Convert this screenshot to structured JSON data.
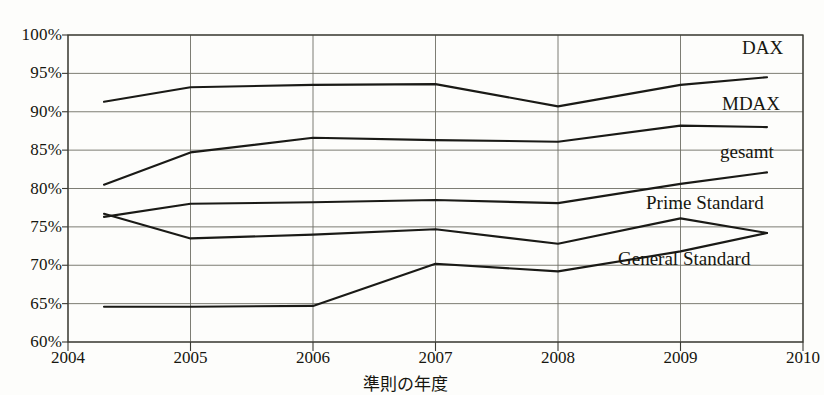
{
  "chart_data": {
    "type": "line",
    "title": "",
    "xlabel": "準則の年度",
    "ylabel": "",
    "categories": [
      "2004",
      "2005",
      "2006",
      "2007",
      "2008",
      "2009",
      "2010"
    ],
    "x": [
      2004,
      2005,
      2006,
      2007,
      2008,
      2009,
      2010
    ],
    "ylim": [
      60,
      100
    ],
    "y_ticks": [
      60,
      65,
      70,
      75,
      80,
      85,
      90,
      95,
      100
    ],
    "y_tick_labels": [
      "60%",
      "65%",
      "70%",
      "75%",
      "80%",
      "85%",
      "90%",
      "95%",
      "100%"
    ],
    "grid": true,
    "legend_position": "right-inline-labels",
    "value_format": "percent",
    "series": [
      {
        "name": "DAX",
        "values": [
          91.3,
          93.2,
          93.5,
          93.6,
          90.7,
          93.5,
          94.5
        ]
      },
      {
        "name": "MDAX",
        "values": [
          80.5,
          84.7,
          86.6,
          86.3,
          86.1,
          88.2,
          88.0
        ]
      },
      {
        "name": "gesamt",
        "values": [
          76.3,
          78.0,
          78.2,
          78.5,
          78.1,
          80.6,
          82.1
        ]
      },
      {
        "name": "Prime Standard",
        "values": [
          76.7,
          73.5,
          74.0,
          74.7,
          72.8,
          76.1,
          74.2
        ]
      },
      {
        "name": "General Standard",
        "values": [
          64.6,
          64.6,
          64.7,
          70.2,
          69.2,
          71.8,
          74.2
        ]
      }
    ],
    "series_labels": [
      {
        "name": "DAX",
        "text": "DAX"
      },
      {
        "name": "MDAX",
        "text": "MDAX"
      },
      {
        "name": "gesamt",
        "text": "gesamt"
      },
      {
        "name": "Prime Standard",
        "text": "Prime Standard"
      },
      {
        "name": "General Standard",
        "text": "General Standard"
      }
    ],
    "colors": {
      "line": "#1a1a16",
      "grid": "#6e6e64",
      "axis": "#3a3a33",
      "background": "#fdfdfb"
    }
  },
  "top_clipped_text": ""
}
